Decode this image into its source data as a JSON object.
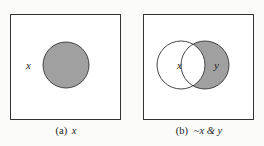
{
  "colors": {
    "background": "#fbfbfa",
    "stroke": "#333333",
    "shade": "#a0a0a0",
    "box_fill": "#ffffff"
  },
  "panels": [
    {
      "id": "a",
      "caption_prefix": "(a)",
      "caption_expr": "x",
      "universe_label": "x",
      "sets": [
        {
          "label": "",
          "cx": 66,
          "cy": 65,
          "r": 23,
          "shaded": true
        }
      ]
    },
    {
      "id": "b",
      "caption_prefix": "(b)",
      "caption_expr": "~x & y",
      "sets": [
        {
          "label": "x",
          "cx": 181,
          "cy": 65,
          "r": 24,
          "shaded": false
        },
        {
          "label": "y",
          "cx": 205,
          "cy": 65,
          "r": 24,
          "shaded": true
        }
      ],
      "shaded_region": "y minus x"
    }
  ]
}
